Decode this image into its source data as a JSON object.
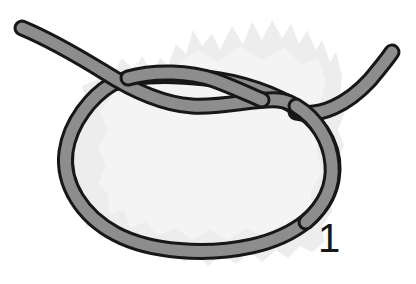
{
  "figure": {
    "kind": "knot-tying-step-illustration",
    "background_color": "#ffffff",
    "step_label": "1",
    "caption": "",
    "rope": {
      "fill_color": "#8d8d8d",
      "outline_color": "#171717",
      "outline_width_px": 3,
      "band_thickness_px": 14,
      "highlight_color": "#a5a5a5",
      "ends": [
        {
          "name": "left-tail",
          "x": 22,
          "y": 28
        },
        {
          "name": "right-tail",
          "x": 392,
          "y": 52
        }
      ]
    },
    "loop": {
      "name": "main-loop",
      "left_x": 65,
      "right_x": 332,
      "top_y": 62,
      "bottom_y": 251
    },
    "crossings": [
      {
        "name": "left-crossing",
        "x": 112,
        "y": 86,
        "over": "tail"
      },
      {
        "name": "center-crossing",
        "x": 222,
        "y": 96,
        "over": "loop"
      },
      {
        "name": "right-crossing",
        "x": 316,
        "y": 131,
        "over": "loop"
      }
    ],
    "backdrop": {
      "name": "textured-backdrop",
      "fill_color": "#ededed",
      "edge_color": "#e3e3e3",
      "description": "faint torn paper or rock texture behind rope"
    }
  }
}
